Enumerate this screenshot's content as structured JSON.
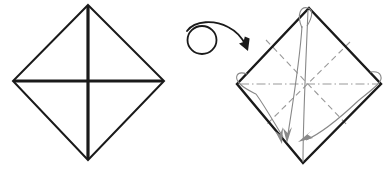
{
  "diagram": {
    "background_color": "#ffffff",
    "width": 392,
    "height": 172,
    "colors": {
      "outline": "#1a1a1a",
      "crease": "#9a9a9a",
      "fold_arrow": "#888888",
      "turn_arrow": "#1a1a1a"
    }
  },
  "panels": [
    {
      "id": "before",
      "name": "left-diamond-panel",
      "shape": "diamond",
      "description": "Square rotated 45 degrees with both diagonals creased",
      "vertices": {
        "top": [
          88,
          5
        ],
        "right": [
          164,
          81
        ],
        "bottom": [
          88,
          160
        ],
        "left": [
          13,
          81
        ]
      },
      "outline_width": 2,
      "creases": [
        {
          "name": "vertical-crease",
          "style": "solid-bold",
          "from": [
            88,
            5
          ],
          "to": [
            88,
            160
          ],
          "width": 3.2
        },
        {
          "name": "horizontal-crease",
          "style": "solid-bold",
          "from": [
            13,
            81
          ],
          "to": [
            164,
            81
          ],
          "width": 3.2
        }
      ]
    },
    {
      "id": "after",
      "name": "right-diamond-panel",
      "shape": "diamond",
      "description": "Diamond with dashed valley creases and corner fold arrows",
      "vertices": {
        "top": [
          309,
          8
        ],
        "right": [
          381,
          84
        ],
        "bottom": [
          303,
          163
        ],
        "left": [
          237,
          84
        ]
      },
      "outline_width": 2.4,
      "creases": [
        {
          "name": "crease-diagonal-nw-se",
          "style": "dashed",
          "from": [
            266,
            40
          ],
          "to": [
            348,
            126
          ]
        },
        {
          "name": "crease-diagonal-ne-sw",
          "style": "dashed",
          "from": [
            350,
            42
          ],
          "to": [
            265,
            126
          ]
        },
        {
          "name": "crease-horizontal-center",
          "style": "dash-dot",
          "from": [
            240,
            84
          ],
          "to": [
            378,
            84
          ]
        }
      ],
      "fold_arrows": [
        {
          "name": "fold-arrow-top-corner",
          "from_corner": "top",
          "to_point": [
            288,
            140
          ],
          "has_loop": true,
          "loop_at": [
            303,
            11
          ]
        },
        {
          "name": "fold-arrow-left-corner",
          "from_corner": "left",
          "to_point": [
            282,
            143
          ],
          "has_loop": true,
          "loop_at": [
            243,
            80
          ]
        },
        {
          "name": "fold-arrow-right-corner",
          "from_corner": "right",
          "to_point": [
            299,
            141
          ],
          "has_loop": true,
          "loop_at": [
            374,
            81
          ]
        }
      ]
    }
  ],
  "turn_over_symbol": {
    "name": "turn-over-arrow",
    "label": "turn over",
    "loop_center": [
      202,
      38
    ],
    "loop_radius": 14,
    "arrow_tip": [
      247,
      47
    ],
    "stroke_width": 1.8
  }
}
